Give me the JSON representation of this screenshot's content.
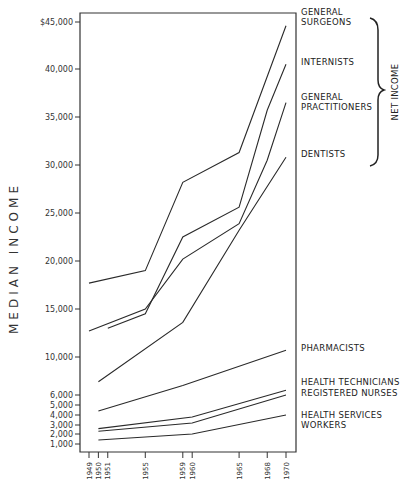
{
  "chart_data": {
    "type": "line",
    "title": "",
    "xlabel": "",
    "ylabel": "MEDIAN INCOME",
    "annotation": "NET INCOME",
    "x_ticks": [
      1949,
      1950,
      1951,
      1955,
      1959,
      1960,
      1965,
      1968,
      1970
    ],
    "y_ticks": [
      {
        "value": 45000,
        "label": "$45,000"
      },
      {
        "value": 40000,
        "label": "40,000"
      },
      {
        "value": 35000,
        "label": "35,000"
      },
      {
        "value": 30000,
        "label": "30,000"
      },
      {
        "value": 25000,
        "label": "25,000"
      },
      {
        "value": 20000,
        "label": "20,000"
      },
      {
        "value": 15000,
        "label": "15,000"
      },
      {
        "value": 10000,
        "label": "10,000"
      },
      {
        "value": 6000,
        "label": "6,000"
      },
      {
        "value": 5000,
        "label": "5,000"
      },
      {
        "value": 4000,
        "label": "4,000"
      },
      {
        "value": 3000,
        "label": "3,000"
      },
      {
        "value": 2000,
        "label": "2,000"
      },
      {
        "value": 1000,
        "label": "1,000"
      }
    ],
    "series": [
      {
        "name": "GENERAL SURGEONS",
        "label_lines": [
          "GENERAL",
          "SURGEONS"
        ],
        "group": "net income",
        "points": [
          [
            1949,
            17700
          ],
          [
            1955,
            19000
          ],
          [
            1959,
            28200
          ],
          [
            1965,
            31300
          ],
          [
            1970,
            44600
          ]
        ]
      },
      {
        "name": "INTERNISTS",
        "label_lines": [
          "INTERNISTS"
        ],
        "group": "net income",
        "points": [
          [
            1951,
            13000
          ],
          [
            1955,
            14500
          ],
          [
            1959,
            22500
          ],
          [
            1965,
            25600
          ],
          [
            1968,
            35700
          ],
          [
            1970,
            40500
          ]
        ]
      },
      {
        "name": "GENERAL PRACTITIONERS",
        "label_lines": [
          "GENERAL",
          "PRACTITIONERS"
        ],
        "group": "net income",
        "points": [
          [
            1949,
            12700
          ],
          [
            1955,
            15000
          ],
          [
            1959,
            20200
          ],
          [
            1965,
            23900
          ],
          [
            1968,
            30500
          ],
          [
            1970,
            36500
          ]
        ]
      },
      {
        "name": "DENTISTS",
        "label_lines": [
          "DENTISTS"
        ],
        "group": "net income",
        "points": [
          [
            1950,
            7400
          ],
          [
            1959,
            13600
          ],
          [
            1965,
            23200
          ],
          [
            1970,
            30800
          ]
        ]
      },
      {
        "name": "PHARMACISTS",
        "label_lines": [
          "PHARMACISTS"
        ],
        "points": [
          [
            1950,
            4400
          ],
          [
            1959,
            7000
          ],
          [
            1970,
            10700
          ]
        ]
      },
      {
        "name": "HEALTH TECHNICIANS",
        "label_lines": [
          "HEALTH TECHNICIANS"
        ],
        "points": [
          [
            1950,
            2600
          ],
          [
            1960,
            3800
          ],
          [
            1970,
            6500
          ]
        ]
      },
      {
        "name": "REGISTERED NURSES",
        "label_lines": [
          "REGISTERED NURSES"
        ],
        "points": [
          [
            1950,
            2300
          ],
          [
            1960,
            3200
          ],
          [
            1970,
            6000
          ]
        ]
      },
      {
        "name": "HEALTH SERVICES WORKERS",
        "label_lines": [
          "HEALTH SERVICES",
          "WORKERS"
        ],
        "points": [
          [
            1950,
            1400
          ],
          [
            1960,
            2000
          ],
          [
            1970,
            4000
          ]
        ]
      }
    ],
    "ylim": [
      0,
      45000
    ],
    "xlim": [
      1949,
      1970
    ],
    "grid": false,
    "legend": "direct labels at right"
  }
}
